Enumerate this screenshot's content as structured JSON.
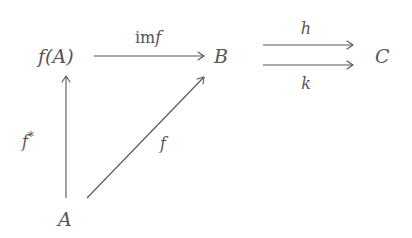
{
  "diagram": {
    "type": "commutative-diagram",
    "nodes": [
      {
        "id": "fA",
        "label": "f(A)",
        "x": 66,
        "y": 57
      },
      {
        "id": "B",
        "label": "B",
        "x": 222,
        "y": 57
      },
      {
        "id": "C",
        "label": "C",
        "x": 383,
        "y": 57
      },
      {
        "id": "A",
        "label": "A",
        "x": 66,
        "y": 220
      }
    ],
    "edges": [
      {
        "id": "imf",
        "from": "f(A)",
        "to": "B",
        "label": "imf",
        "label_prefix": "im",
        "label_var": "f"
      },
      {
        "id": "h",
        "from": "B",
        "to": "C",
        "label": "h"
      },
      {
        "id": "k",
        "from": "B",
        "to": "C",
        "label": "k"
      },
      {
        "id": "fstar",
        "from": "A",
        "to": "f(A)",
        "label": "f*",
        "label_var": "f",
        "label_sup": "*"
      },
      {
        "id": "f",
        "from": "A",
        "to": "B",
        "label": "f"
      }
    ],
    "colors": {
      "ink": "#555555",
      "background": "#ffffff"
    }
  }
}
